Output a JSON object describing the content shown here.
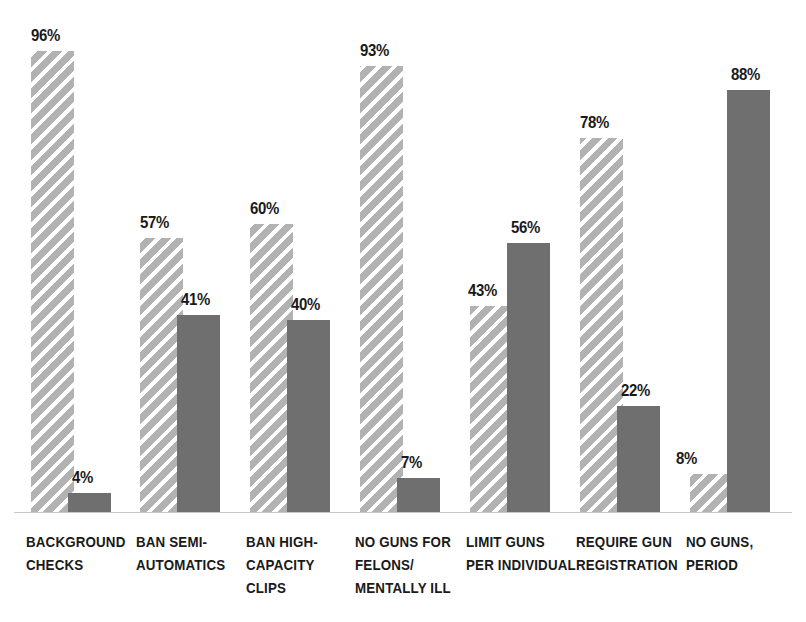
{
  "chart_data": {
    "type": "bar",
    "title": "",
    "subtitle": "",
    "xlabel": "",
    "ylabel": "",
    "ylim": [
      0,
      100
    ],
    "grid": false,
    "legend_position": "none",
    "value_suffix": "%",
    "categories": [
      "Background checks",
      "Ban semi-automatics",
      "Ban high-capacity clips",
      "No guns for felons/ mentally ill",
      "Limit guns per individual",
      "Require gun registration",
      "No guns, period"
    ],
    "category_label_lines": [
      "Background\nchecks",
      "Ban semi-\nautomatics",
      "Ban high-\ncapacity\nclips",
      "No guns for\nfelons/\nmentally ill",
      "Limit guns\nper individual",
      "Require gun\nregistration",
      "No guns,\nperiod"
    ],
    "series": [
      {
        "name": "hatched",
        "style": "diagonal-hatch",
        "color": "#b2b2b2",
        "values": [
          96,
          57,
          60,
          93,
          43,
          78,
          8
        ],
        "labels": [
          "96%",
          "57%",
          "60%",
          "93%",
          "43%",
          "78%",
          "8%"
        ]
      },
      {
        "name": "solid",
        "style": "solid",
        "color": "#6f6f6f",
        "values": [
          4,
          41,
          40,
          7,
          56,
          22,
          88
        ],
        "labels": [
          "4%",
          "41%",
          "40%",
          "7%",
          "56%",
          "22%",
          "88%"
        ]
      }
    ]
  },
  "geometry": {
    "baseline_y": 512,
    "pixels_per_percent": 4.8,
    "bar_width": 43,
    "groups": [
      {
        "hatched_x": 31,
        "solid_x": 68,
        "label_x": 26,
        "hatched_label_x": 31,
        "solid_label_x": 72
      },
      {
        "hatched_x": 140,
        "solid_x": 177,
        "label_x": 136,
        "hatched_label_x": 140,
        "solid_label_x": 181
      },
      {
        "hatched_x": 250,
        "solid_x": 287,
        "label_x": 246,
        "hatched_label_x": 250,
        "solid_label_x": 291
      },
      {
        "hatched_x": 360,
        "solid_x": 397,
        "label_x": 355,
        "hatched_label_x": 360,
        "solid_label_x": 401
      },
      {
        "hatched_x": 470,
        "solid_x": 507,
        "label_x": 466,
        "hatched_label_x": 468,
        "solid_label_x": 511
      },
      {
        "hatched_x": 580,
        "solid_x": 617,
        "label_x": 576,
        "hatched_label_x": 580,
        "solid_label_x": 621
      },
      {
        "hatched_x": 690,
        "solid_x": 727,
        "label_x": 686,
        "hatched_label_x": 676,
        "solid_label_x": 731
      }
    ]
  }
}
